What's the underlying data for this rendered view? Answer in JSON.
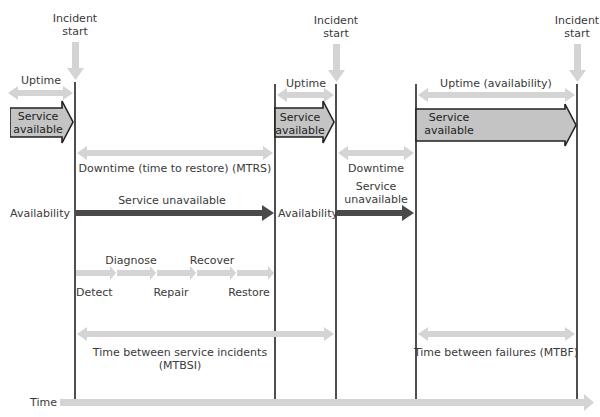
{
  "colors": {
    "light_arrow": "#d4d4d4",
    "dark_arrow": "#4a4a4a",
    "service_box_fill": "#c4c4c4",
    "service_box_stroke": "#222222",
    "timeline_line": "#222222",
    "text": "#3a3a3a"
  },
  "incident_markers": [
    {
      "label_line1": "Incident",
      "label_line2": "start"
    },
    {
      "label_line1": "Incident",
      "label_line2": "start"
    },
    {
      "label_line1": "Incident",
      "label_line2": "start"
    }
  ],
  "uptime_labels": {
    "first": "Uptime",
    "second": "Uptime",
    "third": "Uptime (availability)"
  },
  "service_boxes": [
    {
      "line1": "Service",
      "line2": "available"
    },
    {
      "line1": "Service",
      "line2": "available"
    },
    {
      "line1": "Service",
      "line2": "available"
    }
  ],
  "downtime": {
    "mtrs_label": "Downtime (time to restore) (MTRS)",
    "second_label": "Downtime"
  },
  "availability": {
    "left_label": "Availability",
    "middle_label": "Availability",
    "unavailable_first": "Service unavailable",
    "unavailable_second_line1": "Service",
    "unavailable_second_line2": "unavailable"
  },
  "restore_steps": {
    "detect": "Detect",
    "diagnose": "Diagnose",
    "repair": "Repair",
    "recover": "Recover",
    "restore": "Restore"
  },
  "intervals": {
    "mtbsi_line1": "Time between service incidents",
    "mtbsi_line2": "(MTBSI)",
    "mtbf": "Time between failures (MTBF)"
  },
  "time_axis": {
    "label": "Time"
  }
}
